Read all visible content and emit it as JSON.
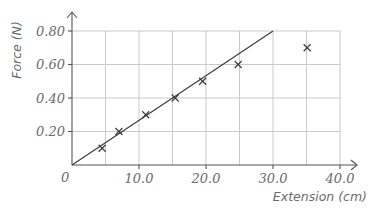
{
  "chart_data": {
    "type": "scatter",
    "title": "",
    "xlabel": "Extension (cm)",
    "ylabel": "Force (N)",
    "xlim": [
      0,
      40
    ],
    "ylim": [
      0,
      0.8
    ],
    "x_ticks": [
      0,
      10,
      20,
      30,
      40
    ],
    "x_tick_labels": [
      "0",
      "10.0",
      "20.0",
      "30.0",
      "40.0"
    ],
    "y_ticks": [
      0.2,
      0.4,
      0.6,
      0.8
    ],
    "y_tick_labels": [
      "0.20",
      "0.40",
      "0.60",
      "0.80"
    ],
    "origin_label": "0",
    "grid": true,
    "grid_x_step": 5,
    "grid_y_step": 0.2,
    "legend": null,
    "series": [
      {
        "name": "measurements",
        "marker": "x",
        "x": [
          4.5,
          7.0,
          11.0,
          15.4,
          19.5,
          24.8,
          35.1
        ],
        "y": [
          0.1,
          0.2,
          0.3,
          0.4,
          0.5,
          0.6,
          0.7
        ]
      },
      {
        "name": "best-fit line",
        "type": "line",
        "x": [
          0,
          30.0
        ],
        "y": [
          0,
          0.8
        ]
      }
    ]
  },
  "colors": {
    "grid": "#c9c9c9",
    "axis": "#555555",
    "line": "#3a3a3a",
    "text": "#6b6b6b"
  }
}
